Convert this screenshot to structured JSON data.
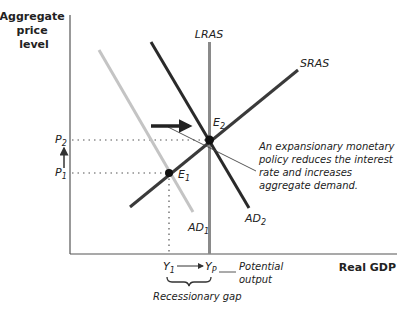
{
  "axes": {
    "y_title_lines": [
      "Aggregate",
      "price",
      "level"
    ],
    "x_title": "Real GDP"
  },
  "curves": {
    "lras": {
      "label": "LRAS",
      "color": "#8a8a8a"
    },
    "sras": {
      "label": "SRAS",
      "color": "#3a3a3a"
    },
    "ad1": {
      "label": "AD",
      "sub": "1",
      "color": "#c4c4c4"
    },
    "ad2": {
      "label": "AD",
      "sub": "2",
      "color": "#2a2a2a"
    }
  },
  "points": {
    "e1": {
      "label": "E",
      "sub": "1"
    },
    "e2": {
      "label": "E",
      "sub": "2"
    }
  },
  "price_levels": {
    "p1": {
      "label": "P",
      "sub": "1"
    },
    "p2": {
      "label": "P",
      "sub": "2"
    }
  },
  "output_levels": {
    "y1": {
      "label": "Y",
      "sub": "1"
    },
    "yp": {
      "label": "Y",
      "sub": "P"
    }
  },
  "annotations": {
    "policy_note_lines": [
      "An expansionary monetary",
      "policy reduces the interest",
      "rate and increases",
      "aggregate demand."
    ],
    "potential_output_lines": [
      "Potential",
      "output"
    ],
    "recessionary_gap": "Recessionary gap"
  }
}
